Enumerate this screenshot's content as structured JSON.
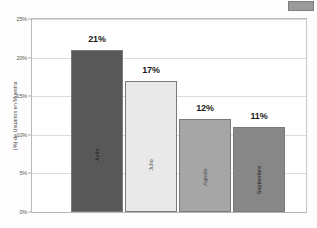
{
  "header": {
    "ghost_text": "",
    "corner_icon": "gray-box"
  },
  "chart_data": {
    "type": "bar",
    "title": "",
    "xlabel": "",
    "ylabel": "(%) de Usuarios en Muestra",
    "categories": [
      "Junio",
      "Julio",
      "Agosto",
      "Septiembre"
    ],
    "values": [
      21,
      17,
      12,
      11
    ],
    "value_labels": [
      "21%",
      "17%",
      "12%",
      "11%"
    ],
    "ylim": [
      0,
      25
    ],
    "yticks": [
      0,
      5,
      10,
      15,
      20,
      25
    ],
    "ytick_labels": [
      "0%",
      "5%",
      "10%",
      "15%",
      "20%",
      "25%"
    ],
    "grid": true,
    "legend": "none",
    "colors": [
      "#585858",
      "#e9e9e9",
      "#a6a6a6",
      "#878787"
    ],
    "border_color": "#7a7a7a"
  }
}
